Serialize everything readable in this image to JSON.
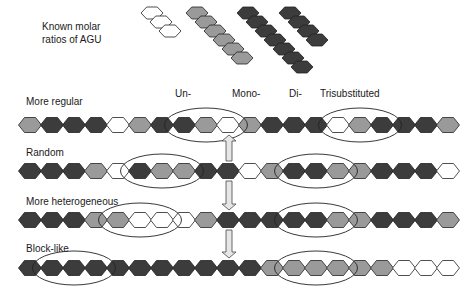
{
  "legend": {
    "title_line1": "Known molar",
    "title_line2": "ratios of AGU",
    "stacks": [
      {
        "type": "un",
        "count": 3
      },
      {
        "type": "mono",
        "count": 6
      },
      {
        "type": "di",
        "count": 7
      },
      {
        "type": "tri",
        "count": 4
      }
    ]
  },
  "column_labels": {
    "un": "Un-",
    "mono": "Mono-",
    "di": "Di-",
    "tri": "Trisubstituted"
  },
  "colors": {
    "un": "#ffffff",
    "mono": "#9a9a9a",
    "di": "#3c3c3c",
    "tri": "#3c3c3c",
    "stroke": "#222222"
  },
  "rows": [
    {
      "label": "More regular",
      "sequence": [
        "mono",
        "di",
        "di",
        "di",
        "un",
        "mono",
        "di",
        "di",
        "mono",
        "un",
        "mono",
        "di",
        "di",
        "di",
        "un",
        "mono",
        "di",
        "di",
        "di",
        "mono"
      ],
      "highlights": [
        [
          7,
          9
        ],
        [
          14,
          16
        ]
      ]
    },
    {
      "label": "Random",
      "sequence": [
        "di",
        "di",
        "di",
        "mono",
        "un",
        "di",
        "mono",
        "mono",
        "di",
        "di",
        "un",
        "mono",
        "di",
        "di",
        "mono",
        "mono",
        "di",
        "di",
        "di",
        "un"
      ],
      "highlights": [
        [
          5,
          7
        ],
        [
          12,
          14
        ]
      ]
    },
    {
      "label": "More heterogeneous",
      "sequence": [
        "di",
        "di",
        "di",
        "mono",
        "mono",
        "un",
        "un",
        "un",
        "mono",
        "di",
        "di",
        "di",
        "di",
        "di",
        "mono",
        "mono",
        "di",
        "di",
        "di",
        "mono"
      ],
      "highlights": [
        [
          4,
          6
        ],
        [
          12,
          14
        ]
      ]
    },
    {
      "label": "Block-like",
      "sequence": [
        "di",
        "di",
        "di",
        "di",
        "di",
        "di",
        "di",
        "di",
        "di",
        "di",
        "di",
        "mono",
        "mono",
        "mono",
        "mono",
        "mono",
        "mono",
        "un",
        "un",
        "un"
      ],
      "highlights": [
        [
          1,
          3
        ],
        [
          12,
          14
        ]
      ]
    }
  ],
  "arrows": [
    {
      "between": [
        1,
        2
      ],
      "direction": "up"
    },
    {
      "between": [
        2,
        3
      ],
      "direction": "down"
    },
    {
      "between": [
        3,
        4
      ],
      "direction": "down"
    }
  ]
}
